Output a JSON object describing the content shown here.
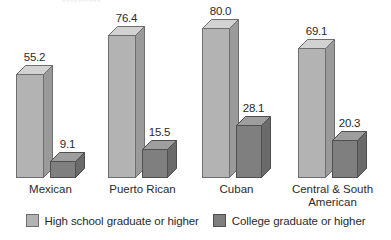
{
  "chart_data": {
    "type": "bar",
    "title": "",
    "subtitle": "",
    "xlabel": "",
    "ylabel": "",
    "ylim": [
      0,
      80
    ],
    "grid": false,
    "legend_position": "bottom",
    "style": "3d-column",
    "categories": [
      "Mexican",
      "Puerto Rican",
      "Cuban",
      "Central & South\nAmerican"
    ],
    "series": [
      {
        "name": "High school graduate or higher",
        "color": "#b3b3b3",
        "values": [
          55.2,
          76.4,
          80.0,
          69.1
        ],
        "labels": [
          "55.2",
          "76.4",
          "80.0",
          "69.1"
        ]
      },
      {
        "name": "College graduate or higher",
        "color": "#7f7f7f",
        "values": [
          9.1,
          15.5,
          28.1,
          20.3
        ],
        "labels": [
          "9.1",
          "15.5",
          "28.1",
          "20.3"
        ]
      }
    ]
  },
  "legend": {
    "items": [
      {
        "label": "High school graduate or higher",
        "color": "#b3b3b3"
      },
      {
        "label": "College graduate or higher",
        "color": "#7f7f7f"
      }
    ]
  },
  "colors": {
    "background": "#ffffff",
    "text": "#2b2b2b",
    "light_bar_front": "#b3b3b3",
    "light_bar_top": "#d2d2d2",
    "light_bar_side": "#9a9a9a",
    "light_bar_outline": "#6e6e6e",
    "dark_bar_front": "#7f7f7f",
    "dark_bar_top": "#9e9e9e",
    "dark_bar_side": "#6a6a6a",
    "dark_bar_outline": "#4f4f4f"
  },
  "title_remnant": "••••••••••"
}
